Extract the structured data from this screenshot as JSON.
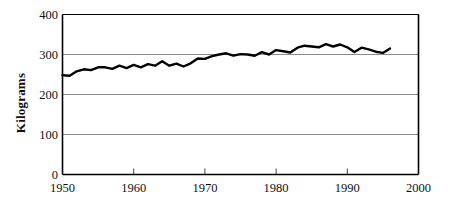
{
  "chart_data": {
    "type": "line",
    "title": "",
    "xlabel": "",
    "ylabel": "Kilograms",
    "xlim": [
      1950,
      2000
    ],
    "ylim": [
      0,
      400
    ],
    "grid": true,
    "grid_axis": "y",
    "legend": false,
    "legend_position": "none",
    "line_color": "#000000",
    "grid_color": "#8c8c8c",
    "axis_color": "#000000",
    "background_color": "#ffffff",
    "xticks": [
      1950,
      1960,
      1970,
      1980,
      1990,
      2000
    ],
    "xtick_labels": [
      "1950",
      "1960",
      "1970",
      "1980",
      "1990",
      "2000"
    ],
    "yticks": [
      0,
      100,
      200,
      300,
      400
    ],
    "ytick_labels": [
      "0",
      "100",
      "200",
      "300",
      "400"
    ],
    "series": [
      {
        "name": "Kilograms",
        "x": [
          1950,
          1951,
          1952,
          1953,
          1954,
          1955,
          1956,
          1957,
          1958,
          1959,
          1960,
          1961,
          1962,
          1963,
          1964,
          1965,
          1966,
          1967,
          1968,
          1969,
          1970,
          1971,
          1972,
          1973,
          1974,
          1975,
          1976,
          1977,
          1978,
          1979,
          1980,
          1981,
          1982,
          1983,
          1984,
          1985,
          1986,
          1987,
          1988,
          1989,
          1990,
          1991,
          1992,
          1993,
          1994,
          1995,
          1996
        ],
        "values": [
          248,
          247,
          258,
          263,
          261,
          268,
          268,
          264,
          272,
          266,
          274,
          268,
          276,
          272,
          283,
          272,
          277,
          270,
          278,
          290,
          289,
          296,
          300,
          303,
          297,
          301,
          300,
          297,
          306,
          300,
          311,
          308,
          305,
          317,
          322,
          320,
          318,
          326,
          320,
          325,
          318,
          306,
          317,
          313,
          307,
          304,
          315
        ]
      }
    ]
  }
}
